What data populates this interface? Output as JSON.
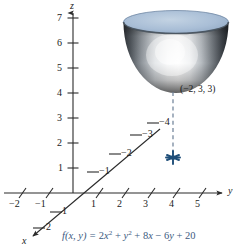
{
  "figure": {
    "formula": {
      "lhs": "f(x, y) = ",
      "full": "f(x, y) = 2x² + y² + 8x − 6y + 20",
      "color": "#3d5a80"
    },
    "point_label": "(−2, 3, 3)",
    "axes": {
      "z": {
        "name": "z",
        "ticks": [
          "7",
          "6",
          "5",
          "4",
          "3",
          "2",
          "1"
        ]
      },
      "y": {
        "name": "y",
        "ticks_negative": [
          "−2",
          "−1"
        ],
        "ticks_positive": [
          "1",
          "2",
          "3",
          "4",
          "5"
        ]
      },
      "x": {
        "name": "x",
        "ticks_positive": [
          "1",
          "2"
        ],
        "ticks_negative": [
          "−1",
          "−2",
          "−3",
          "−4"
        ]
      }
    },
    "colors": {
      "axis": "#2b2b2b",
      "surface_top": "#a8bdd4",
      "surface_rim": "#7e95b0",
      "dashed_line": "#6b7f96",
      "marker": "#1f4e79",
      "formula": "#3d5a80"
    }
  }
}
